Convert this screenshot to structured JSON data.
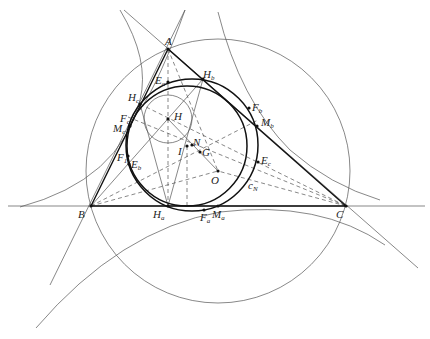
{
  "diagram": {
    "type": "triangle-centers-geometry",
    "vertices": {
      "A": [
        168,
        49
      ],
      "B": [
        91,
        206
      ],
      "C": [
        346,
        206
      ]
    },
    "centers": {
      "H": [
        168,
        119
      ],
      "O": [
        218,
        171
      ],
      "I": [
        187,
        146
      ],
      "N": [
        192,
        145
      ],
      "G": [
        200,
        152
      ]
    },
    "points": {
      "H_a": [
        168,
        206
      ],
      "H_b": [
        203,
        79
      ],
      "H_c": [
        140,
        104
      ],
      "E_a": [
        168,
        82
      ],
      "E_b": [
        129,
        164
      ],
      "E_c": [
        258,
        162
      ],
      "F_a": [
        204,
        210
      ],
      "F_b": [
        249,
        108
      ],
      "F_c": [
        131,
        117
      ],
      "F_1": [
        128,
        156
      ],
      "M_a": [
        218,
        206
      ],
      "M_b": [
        257,
        126
      ],
      "M_c": [
        130,
        126
      ]
    },
    "circles": {
      "circumcircle": {
        "cx": 218,
        "cy": 171,
        "r": 132
      },
      "nine_point": {
        "cx": 192,
        "cy": 145,
        "r": 66
      },
      "incircle": {
        "cx": 187,
        "cy": 146,
        "r": 60
      },
      "small_H": {
        "cx": 168,
        "cy": 119,
        "r": 24
      }
    },
    "labels": {
      "A": "A",
      "B": "B",
      "C": "C",
      "H": "H",
      "O": "O",
      "I": "I",
      "N": "N",
      "G": "G",
      "Ha": "H",
      "Ha_sub": "a",
      "Hb": "H",
      "Hb_sub": "b",
      "Hc": "H",
      "Hc_sub": "c",
      "Ea": "E",
      "Ea_sub": "a",
      "Eb": "E",
      "Eb_sub": "b",
      "Ec": "E",
      "Ec_sub": "c",
      "Fa": "F",
      "Fa_sub": "a",
      "Fb": "F",
      "Fb_sub": "b",
      "Fc": "F",
      "Fc_sub": "c",
      "F1": "F",
      "F1_sub": "1",
      "Ma": "M",
      "Ma_sub": "a",
      "Mb": "M",
      "Mb_sub": "b",
      "Mc": "M",
      "Mc_sub": "c",
      "cN": "c",
      "cN_sub": "N"
    }
  }
}
